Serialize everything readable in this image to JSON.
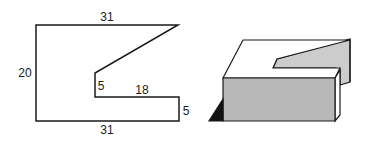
{
  "figure_2d": {
    "dimensions": {
      "top": "31",
      "left": "20",
      "inner_vertical": "5",
      "inner_horizontal": "18",
      "right": "5",
      "bottom": "31"
    }
  },
  "figure_3d": {
    "colors": {
      "front_face": "#b8b8b8",
      "back_panel": "#cccccc",
      "top_face": "#ffffff",
      "shadow": "#111111",
      "outline": "#1a1a1a"
    }
  }
}
